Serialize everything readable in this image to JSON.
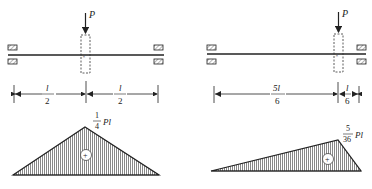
{
  "left_case": {
    "load_label": "P",
    "dim_left": {
      "num": "l",
      "den": "2"
    },
    "dim_right": {
      "num": "l",
      "den": "2"
    },
    "moment_label": {
      "num": "1",
      "den": "4",
      "suffix": "Pl"
    },
    "sign": "+"
  },
  "right_case": {
    "load_label": "P",
    "dim_left": {
      "num": "5l",
      "den": "6"
    },
    "dim_right": {
      "num": "l",
      "den": "6"
    },
    "moment_label": {
      "num": "5",
      "den": "36",
      "suffix": "Pl"
    },
    "sign": "+"
  },
  "colors": {
    "line": "#222222",
    "hatch": "#555555"
  }
}
